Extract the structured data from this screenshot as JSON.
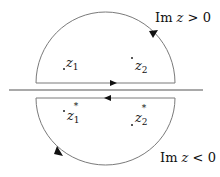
{
  "diagram": {
    "type": "contour-integration",
    "colors": {
      "line": "#7a7a7a",
      "axis": "#555555",
      "arrow": "#111111",
      "text": "#111111",
      "background": "#ffffff"
    },
    "real_axis": {
      "x1": 9,
      "x2": 203,
      "y": 90
    },
    "upper_contour": {
      "chord": {
        "x1": 36,
        "x2": 175,
        "y": 83
      },
      "arc_top_y": 12,
      "direction": "counterclockwise",
      "chord_arrow": "right",
      "arc_arrow": "up-left"
    },
    "lower_contour": {
      "chord": {
        "x1": 36,
        "x2": 175,
        "y": 98
      },
      "arc_bottom_y": 165,
      "direction": "clockwise",
      "chord_arrow": "left",
      "arc_arrow": "down-right"
    },
    "labels": {
      "upper_region": {
        "prefix": "Im ",
        "var": "z",
        "relation": " > 0"
      },
      "lower_region": {
        "prefix": "Im ",
        "var": "z",
        "relation": " < 0"
      },
      "z1": {
        "base": "z",
        "sub": "1"
      },
      "z2": {
        "base": "z",
        "sub": "2"
      },
      "z1_conj": {
        "base": "z",
        "sub": "1",
        "sup": "*"
      },
      "z2_conj": {
        "base": "z",
        "sub": "2",
        "sup": "*"
      }
    }
  }
}
